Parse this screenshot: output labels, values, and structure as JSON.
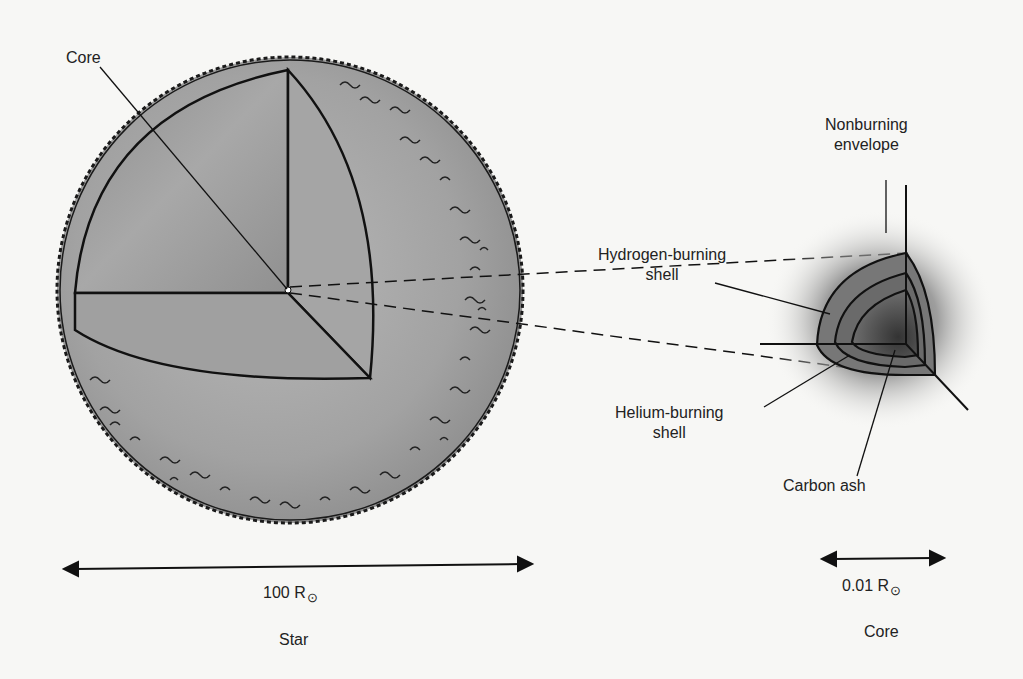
{
  "diagram": {
    "colors": {
      "background": "#f7f7f5",
      "star_fill": "#a9a9a9",
      "cutaway_fill": "#9a9a9a",
      "line": "#1a1a1a",
      "core_shell": "#6e6e6e"
    },
    "star": {
      "core_label": "Core",
      "scale_value": "100 R",
      "scale_symbol": "⊙",
      "caption": "Star"
    },
    "core": {
      "labels": {
        "envelope_line1": "Nonburning",
        "envelope_line2": "envelope",
        "hydrogen_line1": "Hydrogen-burning",
        "hydrogen_line2": "shell",
        "helium_line1": "Helium-burning",
        "helium_line2": "shell",
        "carbon": "Carbon ash"
      },
      "scale_value": "0.01 R",
      "scale_symbol": "⊙",
      "caption": "Core"
    }
  }
}
